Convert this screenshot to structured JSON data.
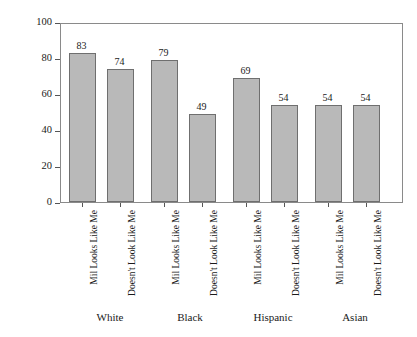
{
  "chart_data": {
    "type": "bar",
    "title": "",
    "xlabel": "",
    "ylabel_line1": "'A Great Deal' + 'Quite A Lot' of",
    "ylabel_line2": "Confidence in Military (%)",
    "ylim": [
      0,
      100
    ],
    "yticks": [
      0,
      20,
      40,
      60,
      80,
      100
    ],
    "ytick_labels": [
      "0",
      "20",
      "40",
      "60",
      "80",
      "100"
    ],
    "grid": false,
    "legend": "none",
    "categories": [
      "Mil Looks Like Me",
      "Doesn't Look Like Me",
      "Mil Looks Like Me",
      "Doesn't Look Like Me",
      "Mil Looks Like Me",
      "Doesn't Look Like Me",
      "Mil Looks Like Me",
      "Doesn't Look Like Me"
    ],
    "values": [
      83,
      74,
      79,
      49,
      69,
      54,
      54,
      54
    ],
    "value_labels": [
      "83",
      "74",
      "79",
      "49",
      "69",
      "54",
      "54",
      "54"
    ],
    "groups": [
      "White",
      "Black",
      "Hispanic",
      "Asian"
    ],
    "group_centers_px": [
      110,
      190,
      273,
      355
    ],
    "bar_left_px": [
      68,
      106,
      150,
      188,
      232,
      270,
      314,
      352
    ],
    "bar_width_px": 27,
    "bar_fill_color": "#b9b9b9",
    "bar_edge_color": "#6f6f6f",
    "frame_color": "#8a8a8a",
    "background_color": "#ffffff"
  }
}
